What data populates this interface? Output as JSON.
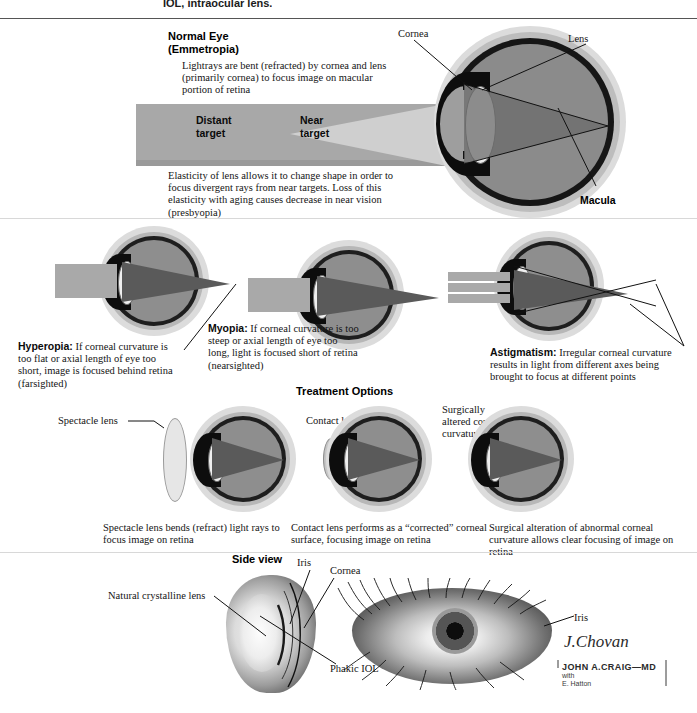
{
  "page": {
    "top_caption": "IOL, intraocular lens.",
    "width": 697,
    "height": 713
  },
  "sections": {
    "normal_eye": {
      "title_line1": "Normal Eye",
      "title_line2": "(Emmetropia)",
      "note_top": "Lightrays are bent (refracted) by cornea and lens (primarily cornea) to focus image on macular portion of retina",
      "note_bottom": "Elasticity of lens allows it to change shape in order to focus divergent rays from near targets. Loss of this elasticity with aging causes decrease in near vision (presbyopia)",
      "labels": {
        "distant_target": "Distant\ntarget",
        "distant_target_l1": "Distant",
        "distant_target_l2": "target",
        "near_target_l1": "Near",
        "near_target_l2": "target",
        "cornea": "Cornea",
        "lens": "Lens",
        "macula": "Macula"
      }
    },
    "conditions": [
      {
        "name": "Hyperopia",
        "term": "Hyperopia:",
        "description": " If corneal curvature is too flat or axial length of eye too short, image is focused behind retina (farsighted)"
      },
      {
        "name": "Myopia",
        "term": "Myopia:",
        "description": " If corneal curvature is too steep or axial length of eye too long, light is focused short of retina (nearsighted)"
      },
      {
        "name": "Astigmatism",
        "term": "Astigmatism:",
        "description": " Irregular corneal curvature results in light from different axes being brought to focus at different points"
      }
    ],
    "treatment": {
      "heading": "Treatment Options",
      "options": [
        {
          "callout": "Spectacle lens",
          "caption": "Spectacle lens bends (refract) light rays to focus image on retina"
        },
        {
          "callout": "Contact lens",
          "caption": "Contact lens performs as a “corrected” corneal surface, focusing image on retina"
        },
        {
          "callout_l1": "Surgically",
          "callout_l2": "altered corneal",
          "callout_l3": "curvature",
          "caption": "Surgical alteration of abnormal corneal curvature allows clear focusing of image on retina"
        }
      ]
    },
    "side_view": {
      "heading": "Side view",
      "labels": {
        "natural_lens": "Natural crystalline lens",
        "iris": "Iris",
        "cornea": "Cornea",
        "phakic_iol": "Phakic IOL",
        "iris_right": "Iris"
      }
    },
    "credits": {
      "signature": "J.Chovan",
      "artist": "JOHN A.CRAIG—MD",
      "with_label": "with",
      "collaborator": "E. Hatton"
    }
  },
  "colors": {
    "ink": "#141414",
    "sclera": "#b7b7b7",
    "choroid": "#1e1e1e",
    "vitreous": "#8e8e8e",
    "lens": "#efefef",
    "ray": "#4f4f4f",
    "beam": "#a9a9a9",
    "rule": "#555555"
  }
}
